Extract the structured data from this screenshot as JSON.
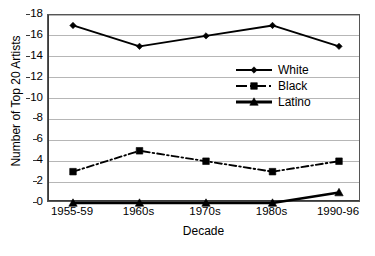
{
  "chart_data": {
    "type": "line",
    "title": "",
    "xlabel": "Decade",
    "ylabel": "Number of Top 20 Artists",
    "categories": [
      "1955-59",
      "1960s",
      "1970s",
      "1980s",
      "1990-96"
    ],
    "series": [
      {
        "name": "White",
        "values": [
          17,
          15,
          16,
          17,
          15
        ],
        "marker": "diamond",
        "line_style": "solid",
        "color": "#000000"
      },
      {
        "name": "Black",
        "values": [
          3,
          5,
          4,
          3,
          4
        ],
        "marker": "square",
        "line_style": "dash-dot",
        "color": "#000000"
      },
      {
        "name": "Latino",
        "values": [
          0,
          0,
          0,
          0,
          1
        ],
        "marker": "triangle",
        "line_style": "solid-thick",
        "color": "#000000"
      }
    ],
    "ylim": [
      0,
      18
    ],
    "ytick_step": 2,
    "yticks": [
      0,
      2,
      4,
      6,
      8,
      10,
      12,
      14,
      16,
      18
    ],
    "ytick_labels": [
      "0",
      "2",
      "4",
      "6",
      "8",
      "10",
      "12",
      "14",
      "16",
      "18"
    ],
    "grid": true,
    "grid_axis": "y",
    "legend_position": "inside-upper-right",
    "legend": [
      "White",
      "Black",
      "Latino"
    ],
    "plot_border": true,
    "background": "#ffffff",
    "grid_color": "#b6b6b6",
    "axis_color": "#3a3a3a"
  }
}
